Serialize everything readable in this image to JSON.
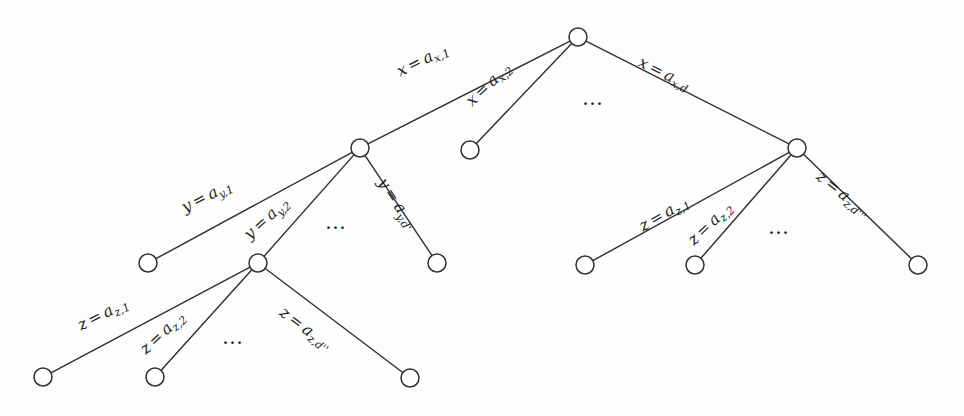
{
  "figure": {
    "kind": "tree-diagram",
    "background_color": "#fdfdfd",
    "stroke_color": "#2f3133",
    "text_color": "#1d1f21",
    "width": 964,
    "height": 416
  },
  "nodes": [
    {
      "id": "root",
      "label": "",
      "x": 578,
      "y": 37,
      "r": 9
    },
    {
      "id": "y-node",
      "label": "",
      "x": 360,
      "y": 148,
      "r": 9
    },
    {
      "id": "x2-leaf",
      "label": "",
      "x": 470,
      "y": 150,
      "r": 9
    },
    {
      "id": "z-node-right",
      "label": "",
      "x": 797,
      "y": 148,
      "r": 9
    },
    {
      "id": "y1-leaf",
      "label": "",
      "x": 148,
      "y": 263,
      "r": 9
    },
    {
      "id": "z-node-left",
      "label": "",
      "x": 258,
      "y": 263,
      "r": 9
    },
    {
      "id": "yd-leaf",
      "label": "",
      "x": 437,
      "y": 263,
      "r": 9
    },
    {
      "id": "zl1-leaf",
      "label": "",
      "x": 43,
      "y": 377,
      "r": 9
    },
    {
      "id": "zl2-leaf",
      "label": "",
      "x": 155,
      "y": 377,
      "r": 9
    },
    {
      "id": "zld-leaf",
      "label": "",
      "x": 410,
      "y": 378,
      "r": 9
    },
    {
      "id": "zr1-leaf",
      "label": "",
      "x": 585,
      "y": 265,
      "r": 9
    },
    {
      "id": "zr2-leaf",
      "label": "",
      "x": 695,
      "y": 265,
      "r": 9
    },
    {
      "id": "zrd-leaf",
      "label": "",
      "x": 918,
      "y": 265,
      "r": 9
    }
  ],
  "edges": [
    {
      "id": "e-x1",
      "from": "root",
      "to": "y-node",
      "label": {
        "var": "x",
        "eq": "=",
        "base": "a",
        "sub": "x,1"
      },
      "lx": 398,
      "ly": 73,
      "rot": -26.5
    },
    {
      "id": "e-x2",
      "from": "root",
      "to": "x2-leaf",
      "label": {
        "var": "x",
        "eq": "=",
        "base": "a",
        "sub": "x,2"
      },
      "lx": 469,
      "ly": 104,
      "rot": -43.5
    },
    {
      "id": "e-xd",
      "from": "root",
      "to": "z-node-right",
      "label": {
        "var": "x",
        "eq": "=",
        "base": "a",
        "sub": "x,d"
      },
      "lx": 639,
      "ly": 62,
      "rot": 26.0
    },
    {
      "id": "e-y1",
      "from": "y-node",
      "to": "y1-leaf",
      "label": {
        "var": "y",
        "eq": "=",
        "base": "a",
        "sub": "y,1"
      },
      "lx": 183,
      "ly": 209,
      "rot": -27.0
    },
    {
      "id": "e-y2",
      "from": "y-node",
      "to": "z-node-left",
      "label": {
        "var": "y",
        "eq": "=",
        "base": "a",
        "sub": "y,2"
      },
      "lx": 247,
      "ly": 237,
      "rot": -42.0
    },
    {
      "id": "e-yd",
      "from": "y-node",
      "to": "yd-leaf",
      "label": {
        "var": "y",
        "eq": "=",
        "base": "a",
        "sub": "y,d'"
      },
      "lx": 381,
      "ly": 180,
      "rot": 57.0
    },
    {
      "id": "e-zl1",
      "from": "z-node-left",
      "to": "zl1-leaf",
      "label": {
        "var": "z",
        "eq": "=",
        "base": "a",
        "sub": "z,1"
      },
      "lx": 79,
      "ly": 327,
      "rot": -27.0
    },
    {
      "id": "e-zl2",
      "from": "z-node-left",
      "to": "zl2-leaf",
      "label": {
        "var": "z",
        "eq": "=",
        "base": "a",
        "sub": "z,2"
      },
      "lx": 143,
      "ly": 352,
      "rot": -43.0
    },
    {
      "id": "e-zld",
      "from": "z-node-left",
      "to": "zld-leaf",
      "label": {
        "var": "z",
        "eq": "=",
        "base": "a",
        "sub": "z,d''"
      },
      "lx": 281,
      "ly": 311,
      "rot": 37.0
    },
    {
      "id": "e-zr1",
      "from": "z-node-right",
      "to": "zr1-leaf",
      "label": {
        "var": "z",
        "eq": "=",
        "base": "a",
        "sub": "z,1"
      },
      "lx": 641,
      "ly": 228,
      "rot": -30.0
    },
    {
      "id": "e-zr2",
      "from": "z-node-right",
      "to": "zr2-leaf",
      "label": {
        "var": "z",
        "eq": "=",
        "base": "a",
        "sub": "z,2"
      },
      "lx": 691,
      "ly": 243,
      "rot": -44.0
    },
    {
      "id": "e-zrd",
      "from": "z-node-right",
      "to": "zrd-leaf",
      "label": {
        "var": "z",
        "eq": "=",
        "base": "a",
        "sub": "z,d'''"
      },
      "lx": 818,
      "ly": 175,
      "rot": 39.0
    }
  ],
  "ellipses": [
    {
      "id": "ellipsis-root",
      "text": "…",
      "x": 582,
      "y": 88
    },
    {
      "id": "ellipsis-y-level",
      "text": "…",
      "x": 325,
      "y": 212
    },
    {
      "id": "ellipsis-z-left",
      "text": "…",
      "x": 222,
      "y": 327
    },
    {
      "id": "ellipsis-z-right",
      "text": "…",
      "x": 768,
      "y": 217
    }
  ]
}
